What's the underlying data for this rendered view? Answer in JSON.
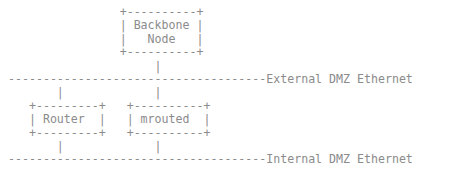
{
  "diagram": {
    "type": "ascii-network-diagram",
    "background_color": "#ffffff",
    "line_color": "#8b8b8b",
    "text_color": "#7d7d7d",
    "nodes": [
      {
        "id": "backbone-node",
        "label": "Backbone Node",
        "label_lines": [
          "Backbone",
          "Node"
        ],
        "shape": "box"
      },
      {
        "id": "router",
        "label": "Router",
        "label_lines": [
          "Router"
        ],
        "shape": "box"
      },
      {
        "id": "mrouted",
        "label": "mrouted",
        "label_lines": [
          "mrouted"
        ],
        "shape": "box"
      }
    ],
    "networks": [
      {
        "id": "external-dmz-ethernet",
        "label": "External DMZ Ethernet",
        "style": "dashed-bus"
      },
      {
        "id": "internal-dmz-ethernet",
        "label": "Internal DMZ Ethernet",
        "style": "dashed-bus"
      }
    ],
    "connections": [
      {
        "from": "backbone-node",
        "to": "external-dmz-ethernet"
      },
      {
        "from": "external-dmz-ethernet",
        "to": "router"
      },
      {
        "from": "external-dmz-ethernet",
        "to": "mrouted"
      },
      {
        "from": "router",
        "to": "internal-dmz-ethernet"
      },
      {
        "from": "mrouted",
        "to": "internal-dmz-ethernet"
      }
    ],
    "art_rows": [
      "                +----------+",
      "                | Backbone |",
      "                |   Node   |",
      "                +----------+",
      "                     |",
      "-------------------------------------External DMZ Ethernet",
      "       |             |",
      "   +---------+   +----------+",
      "   | Router  |   | mrouted  |",
      "   +---------+   +----------+",
      "       |             |",
      "-------------------------------------Internal DMZ Ethernet"
    ]
  }
}
